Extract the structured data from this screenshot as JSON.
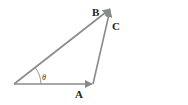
{
  "diagram": {
    "type": "vector-triangle",
    "stroke_color": "#8a8a8a",
    "label_color": "#222222",
    "vectors": [
      {
        "name": "A",
        "label": "A",
        "from": [
          14,
          84
        ],
        "to": [
          93,
          84
        ]
      },
      {
        "name": "B",
        "label": "B",
        "from": [
          14,
          84
        ],
        "to": [
          111,
          8
        ]
      },
      {
        "name": "C",
        "label": "C",
        "from": [
          93,
          84
        ],
        "to": [
          111,
          8
        ]
      }
    ],
    "angle": {
      "label": "θ",
      "between": [
        "A",
        "B"
      ]
    }
  }
}
